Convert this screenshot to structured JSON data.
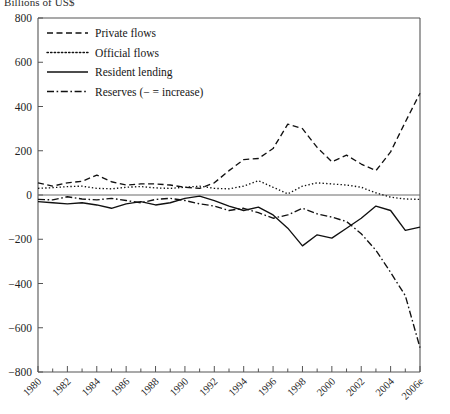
{
  "chart_title": "Billions of US$",
  "legend": {
    "position": "top-left-inside",
    "entries": [
      {
        "label": "Private flows",
        "dash": "6,3.5",
        "name": "private-flows"
      },
      {
        "label": "Official flows",
        "dash": "1.4,2.2",
        "name": "official-flows"
      },
      {
        "label": "Resident lending",
        "dash": "none",
        "name": "resident-lending"
      },
      {
        "label": "Reserves (− = increase)",
        "dash": "7,2.6,1.6,2.6",
        "name": "reserves"
      }
    ]
  },
  "axes": {
    "y_ticks": [
      800,
      600,
      400,
      200,
      0,
      -200,
      -400,
      -600,
      -800
    ],
    "y_tick_labels": [
      "800",
      "600",
      "400",
      "200",
      "0",
      "−200",
      "−400",
      "−600",
      "−800"
    ],
    "ylim": [
      -800,
      800
    ],
    "xlim": [
      1980,
      2006
    ],
    "x_tick_labels": [
      "1980",
      "1982",
      "1984",
      "1986",
      "1988",
      "1990",
      "1992",
      "1994",
      "1996",
      "1998",
      "2000",
      "2002",
      "2004",
      "2006e"
    ],
    "x_tick_years": [
      1980,
      1982,
      1984,
      1986,
      1988,
      1990,
      1992,
      1994,
      1996,
      1998,
      2000,
      2002,
      2004,
      2006
    ],
    "x_minor_years": [
      1981,
      1983,
      1985,
      1987,
      1989,
      1991,
      1993,
      1995,
      1997,
      1999,
      2001,
      2003,
      2005
    ],
    "xlabel": "",
    "ylabel": "",
    "grid": false,
    "x_label_rotation": 45
  },
  "chart_data": {
    "type": "line",
    "title": "Billions of US$",
    "xlabel": "",
    "ylabel": "Billions of US$",
    "ylim": [
      -800,
      800
    ],
    "xlim": [
      1980,
      2006
    ],
    "grid": false,
    "legend_position": "top-left-inside",
    "x": [
      1980,
      1981,
      1982,
      1983,
      1984,
      1985,
      1986,
      1987,
      1988,
      1989,
      1990,
      1991,
      1992,
      1993,
      1994,
      1995,
      1996,
      1997,
      1998,
      1999,
      2000,
      2001,
      2002,
      2003,
      2004,
      2005,
      2006
    ],
    "series": [
      {
        "name": "Private flows",
        "style": "dashed",
        "values": [
          55,
          40,
          55,
          62,
          90,
          60,
          45,
          50,
          50,
          45,
          35,
          30,
          55,
          110,
          160,
          165,
          210,
          320,
          300,
          215,
          150,
          180,
          140,
          110,
          195,
          330,
          460
        ]
      },
      {
        "name": "Official flows",
        "style": "dotted",
        "values": [
          30,
          33,
          38,
          40,
          30,
          28,
          35,
          38,
          32,
          30,
          35,
          40,
          30,
          28,
          40,
          65,
          35,
          5,
          40,
          55,
          50,
          45,
          35,
          10,
          -10,
          -18,
          -20
        ]
      },
      {
        "name": "Resident lending",
        "style": "solid",
        "values": [
          -30,
          -35,
          -40,
          -35,
          -45,
          -60,
          -40,
          -30,
          -45,
          -35,
          -15,
          -5,
          -25,
          -50,
          -70,
          -55,
          -90,
          -150,
          -230,
          -180,
          -195,
          -150,
          -105,
          -50,
          -70,
          -160,
          -145
        ]
      },
      {
        "name": "Reserves (− = increase)",
        "style": "dash-dot",
        "values": [
          -20,
          -22,
          -8,
          -18,
          -22,
          -15,
          -25,
          -35,
          -20,
          -15,
          -25,
          -40,
          -50,
          -70,
          -60,
          -80,
          -105,
          -90,
          -60,
          -85,
          -100,
          -120,
          -175,
          -250,
          -350,
          -455,
          -690
        ]
      }
    ]
  }
}
